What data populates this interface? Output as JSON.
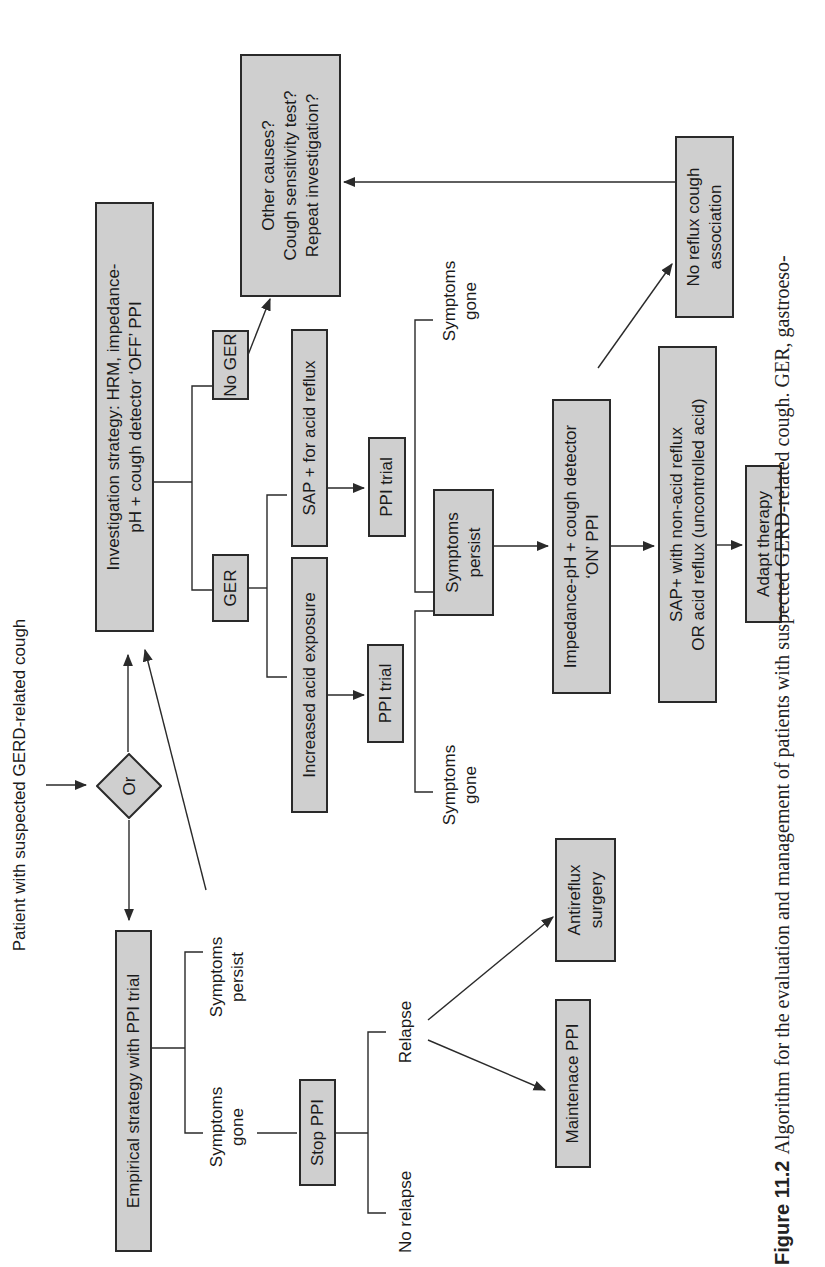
{
  "diagram": {
    "start_label": "Patient with suspected GERD-related cough",
    "decision": {
      "label": "Or"
    },
    "empirical": {
      "box": "Empirical strategy with PPI trial",
      "outcome_persist": "Symptoms\npersist",
      "outcome_gone": "Symptoms\ngone",
      "stop_ppi": "Stop PPI",
      "relapse": "Relapse",
      "no_relapse": "No relapse",
      "maintenance": "Maintenace PPI",
      "surgery": "Antireflux\nsurgery"
    },
    "investigation": {
      "box": "Investigation strategy: HRM, impedance-\npH + cough detector  ‘OFF’ PPI",
      "ger": "GER",
      "no_ger": "No GER",
      "other_causes": "Other causes?\nCough sensitivity test?\nRepeat investigation?",
      "increased_acid": "Increased acid exposure",
      "sap_acid": "SAP + for acid reflux",
      "ppi_trial_1": "PPI trial",
      "ppi_trial_2": "PPI trial",
      "symptoms_gone_1": "Symptoms\ngone",
      "symptoms_gone_2": "Symptoms\ngone",
      "symptoms_persist": "Symptoms\npersist",
      "impedance_on": "Impedance-pH + cough detector\n‘ON’ PPI",
      "sap_nonacid": "SAP+ with non-acid reflux\nOR acid reflux (uncontrolled acid)",
      "adapt": "Adapt therapy",
      "no_association": "No reflux cough\nassociation"
    }
  },
  "caption": {
    "figure_number": "Figure 11.2",
    "text": "Algorithm for the evaluation and management of patients with suspected GERD-related cough. GER, gastroeso-"
  },
  "colors": {
    "box_fill": "#cfcfcf",
    "stroke": "#2a2a2a",
    "background": "#ffffff"
  }
}
